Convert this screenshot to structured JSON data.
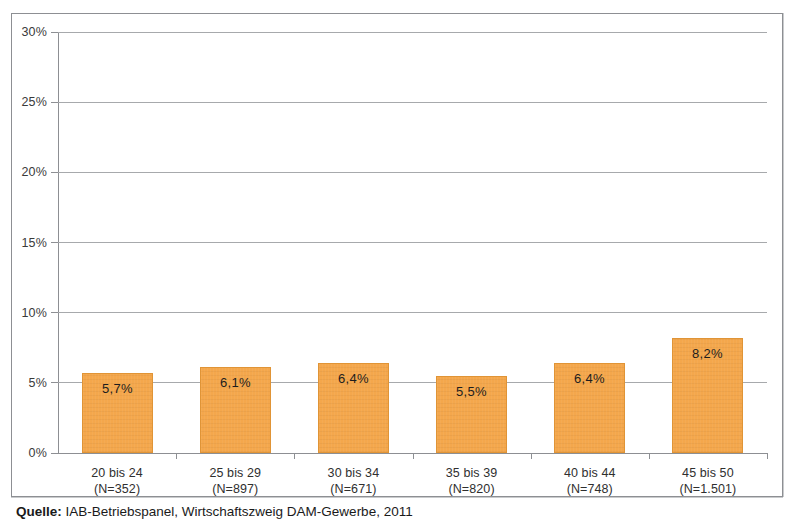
{
  "caption": {
    "prefix": "Quelle:",
    "text": "IAB-Betriebspanel, Wirtschaftszweig DAM-Gewerbe, 2011"
  },
  "chart_data": {
    "type": "bar",
    "title": "",
    "subtitle": "",
    "xlabel": "",
    "ylabel": "",
    "categories": [
      "20 bis 24",
      "25 bis 29",
      "30 bis 34",
      "35 bis 39",
      "40 bis 44",
      "45 bis 50"
    ],
    "category_sublabels": [
      "(N=352)",
      "(N=897)",
      "(N=671)",
      "(N=820)",
      "(N=748)",
      "(N=1.501)"
    ],
    "values": [
      5.7,
      6.1,
      6.4,
      5.5,
      6.4,
      8.2
    ],
    "value_labels": [
      "5,7%",
      "6,1%",
      "6,4%",
      "5,5%",
      "6,4%",
      "8,2%"
    ],
    "ylim": [
      0,
      30
    ],
    "ytick_values": [
      0,
      5,
      10,
      15,
      20,
      25,
      30
    ],
    "ytick_labels": [
      "0%",
      "5%",
      "10%",
      "15%",
      "20%",
      "25%",
      "30%"
    ],
    "grid": true,
    "legend": "none",
    "bar_color": "#f4a74c",
    "bar_border_color": "#e09436",
    "gridline_color": "#a7a9ac",
    "axis_color": "#8d8f93"
  }
}
